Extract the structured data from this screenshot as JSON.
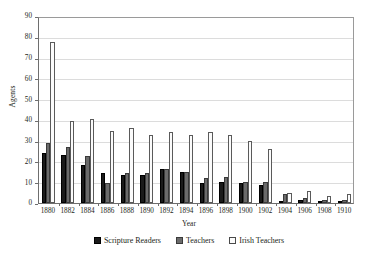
{
  "chart_data": {
    "type": "bar",
    "title": "",
    "xlabel": "Year",
    "ylabel": "Agents",
    "ylim": [
      0,
      90
    ],
    "ytick_labels": [
      "0",
      "10",
      "20",
      "30",
      "40",
      "50",
      "60",
      "70",
      "80",
      "90"
    ],
    "ytick_values": [
      0,
      10,
      20,
      30,
      40,
      50,
      60,
      70,
      80,
      90
    ],
    "grid": true,
    "legend_position": "bottom",
    "categories": [
      "1880",
      "1882",
      "1884",
      "1886",
      "1888",
      "1890",
      "1892",
      "1894",
      "1896",
      "1898",
      "1900",
      "1902",
      "1904",
      "1906",
      "1908",
      "1910"
    ],
    "series": [
      {
        "name": "Scripture Readers",
        "color": "#1a1a1a",
        "values": [
          24,
          23,
          18.5,
          14.5,
          13.5,
          13.5,
          16.5,
          15,
          9.5,
          10,
          9.5,
          8.5,
          1,
          1.5,
          1,
          1
        ]
      },
      {
        "name": "Teachers",
        "color": "#6b6b6b",
        "values": [
          29,
          27,
          22.5,
          9.5,
          14.5,
          14.5,
          16.5,
          15,
          12,
          12.5,
          10,
          10,
          4.5,
          2.5,
          1.5,
          1.5
        ]
      },
      {
        "name": "Irish Teachers",
        "color": "#fbfbfb",
        "values": [
          77.5,
          39.5,
          40.5,
          34.5,
          36,
          32.5,
          34,
          32.5,
          34,
          32.5,
          30,
          26,
          5,
          6,
          3.5,
          4.5
        ]
      }
    ]
  },
  "legend": {
    "items": [
      {
        "label": "Scripture Readers"
      },
      {
        "label": "Teachers"
      },
      {
        "label": "Irish Teachers"
      }
    ]
  },
  "axes": {
    "y_title": "Agents",
    "x_title": "Year"
  }
}
